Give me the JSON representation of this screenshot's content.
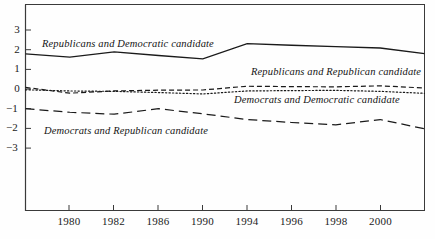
{
  "figure": {
    "background_color": "#fefefe",
    "line_color": "#1a1a1a",
    "frame_color": "#3a3a3a"
  },
  "chart_data": {
    "type": "line",
    "title": "",
    "subtitle": "",
    "xlabel": "",
    "ylabel": "",
    "grid": false,
    "legend_position": "inline-annotations",
    "x_axis_type": "categorical-even-spacing",
    "categories": [
      1978,
      1980,
      1982,
      1986,
      1990,
      1994,
      1996,
      1998,
      2000,
      2002
    ],
    "x_tick_labels": [
      "",
      "1980",
      "1982",
      "1986",
      "1990",
      "1994",
      "1996",
      "1998",
      "2000",
      ""
    ],
    "x_ticks_visible": [
      "1980",
      "1982",
      "1986",
      "1990",
      "1994",
      "1996",
      "1998",
      "2000"
    ],
    "ylim": [
      -3.7,
      3.6
    ],
    "y_ticks": [
      3,
      2,
      1,
      0,
      -1,
      -2,
      -3
    ],
    "y_tick_labels": [
      "3",
      "2",
      "1",
      "0",
      "−1",
      "−2",
      "−3"
    ],
    "series": [
      {
        "name": "Republicans and Democratic candidate",
        "style": "solid",
        "values": [
          1.78,
          1.62,
          1.88,
          1.7,
          1.53,
          2.3,
          2.22,
          2.15,
          2.08,
          1.8
        ],
        "label_position": {
          "x": 42,
          "y": 38
        }
      },
      {
        "name": "Republicans and Republican candidate",
        "style": "dashed-short",
        "values": [
          0.08,
          -0.21,
          -0.1,
          -0.06,
          -0.05,
          0.14,
          0.12,
          0.11,
          0.16,
          0.05
        ],
        "label_position": {
          "x": 251,
          "y": 66
        }
      },
      {
        "name": "Democrats and Democratic candidate",
        "style": "dotted",
        "values": [
          -0.04,
          -0.1,
          -0.12,
          -0.18,
          -0.25,
          -0.1,
          -0.08,
          -0.07,
          -0.12,
          -0.22
        ],
        "label_position": {
          "x": 234,
          "y": 94
        }
      },
      {
        "name": "Democrats and Republican candidate",
        "style": "dashed-long",
        "values": [
          -1.0,
          -1.18,
          -1.28,
          -1.0,
          -1.26,
          -1.55,
          -1.7,
          -1.82,
          -1.55,
          -2.02
        ],
        "label_position": {
          "x": 44,
          "y": 125
        }
      }
    ]
  }
}
